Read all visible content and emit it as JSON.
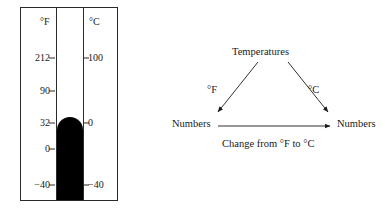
{
  "thermometer": {
    "name": "dual-scale-thermometer",
    "scales": [
      {
        "id": "fahrenheit",
        "header": "°F"
      },
      {
        "id": "celsius",
        "header": "°C"
      }
    ],
    "mercury_color": "#000000",
    "frame_color": "#2b2b2b",
    "ticks": [
      {
        "fahrenheit": "212",
        "celsius": "100"
      },
      {
        "fahrenheit": "90",
        "celsius": ""
      },
      {
        "fahrenheit": "32",
        "celsius": "0"
      },
      {
        "fahrenheit": "0",
        "celsius": ""
      },
      {
        "fahrenheit": "−40",
        "celsius": "−40"
      }
    ]
  },
  "diagram": {
    "name": "temperature-conversion-mapping",
    "top_label": "Temperatures",
    "left_node": "Numbers",
    "right_node": "Numbers",
    "left_arrow_label": "°F",
    "right_arrow_label": "°C",
    "bottom_arrow_label": "Change from °F to °C",
    "line_color": "#1a1a1a"
  }
}
